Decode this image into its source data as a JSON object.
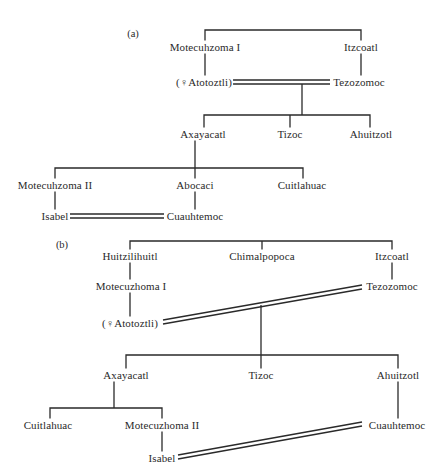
{
  "diagram": {
    "type": "genealogy",
    "colors": {
      "ink": "#2a2a2a",
      "background": "#ffffff"
    },
    "panels": [
      {
        "label": "(a)",
        "nodes": {
          "motecuhzoma1": "Motecuhzoma I",
          "itzcoatl": "Itzcoatl",
          "atotoztli": "(♀Atotoztli)",
          "tezozomoc": "Tezozomoc",
          "axayacatl": "Axayacatl",
          "tizoc": "Tizoc",
          "ahuitzotl": "Ahuitzotl",
          "motecuhzoma2": "Motecuhzoma II",
          "abocaci": "Abocaci",
          "cuitlahuac": "Cuitlahuac",
          "isabel": "Isabel",
          "cuauhtemoc": "Cuauhtemoc"
        },
        "relations": [
          {
            "type": "siblings",
            "members": [
              "Motecuhzoma I",
              "Itzcoatl"
            ]
          },
          {
            "type": "parent-child",
            "parent": "Motecuhzoma I",
            "child": "(♀Atotoztli)"
          },
          {
            "type": "parent-child",
            "parent": "Itzcoatl",
            "child": "Tezozomoc"
          },
          {
            "type": "marriage",
            "members": [
              "(♀Atotoztli)",
              "Tezozomoc"
            ]
          },
          {
            "type": "children",
            "parents": [
              "(♀Atotoztli)",
              "Tezozomoc"
            ],
            "children": [
              "Axayacatl",
              "Tizoc",
              "Ahuitzotl"
            ]
          },
          {
            "type": "children",
            "parents": [
              "Axayacatl"
            ],
            "children": [
              "Motecuhzoma II",
              "Abocaci",
              "Cuitlahuac"
            ]
          },
          {
            "type": "parent-child",
            "parent": "Motecuhzoma II",
            "child": "Isabel"
          },
          {
            "type": "parent-child",
            "parent": "Abocaci",
            "child": "Cuauhtemoc"
          },
          {
            "type": "marriage",
            "members": [
              "Isabel",
              "Cuauhtemoc"
            ]
          }
        ]
      },
      {
        "label": "(b)",
        "nodes": {
          "huitzilihuitl": "Huitzilihuitl",
          "chimalpopoca": "Chimalpopoca",
          "itzcoatl": "Itzcoatl",
          "motecuzhoma1": "Motecuzhoma I",
          "tezozomoc": "Tezozomoc",
          "atotoztli": "(♀Atotoztli)",
          "axayacatl": "Axayacatl",
          "tizoc": "Tizoc",
          "ahuitzotl": "Ahuitzotl",
          "cuitlahuac": "Cuitlahuac",
          "motecuzhoma2": "Motecuzhoma II",
          "cuauhtemoc": "Cuauhtemoc",
          "isabel": "Isabel"
        },
        "relations": [
          {
            "type": "siblings",
            "members": [
              "Huitzilihuitl",
              "Chimalpopoca",
              "Itzcoatl"
            ]
          },
          {
            "type": "parent-child",
            "parent": "Huitzilihuitl",
            "child": "Motecuzhoma I"
          },
          {
            "type": "parent-child",
            "parent": "Itzcoatl",
            "child": "Tezozomoc"
          },
          {
            "type": "parent-child",
            "parent": "Motecuzhoma I",
            "child": "(♀Atotoztli)"
          },
          {
            "type": "marriage",
            "members": [
              "(♀Atotoztli)",
              "Tezozomoc"
            ]
          },
          {
            "type": "children",
            "parents": [
              "(♀Atotoztli)",
              "Tezozomoc"
            ],
            "children": [
              "Axayacatl",
              "Tizoc",
              "Ahuitzotl"
            ]
          },
          {
            "type": "children",
            "parents": [
              "Axayacatl"
            ],
            "children": [
              "Cuitlahuac",
              "Motecuzhoma II"
            ]
          },
          {
            "type": "parent-child",
            "parent": "Ahuitzotl",
            "child": "Cuauhtemoc"
          },
          {
            "type": "parent-child",
            "parent": "Motecuzhoma II",
            "child": "Isabel"
          },
          {
            "type": "marriage",
            "members": [
              "Isabel",
              "Cuauhtemoc"
            ]
          }
        ]
      }
    ]
  }
}
